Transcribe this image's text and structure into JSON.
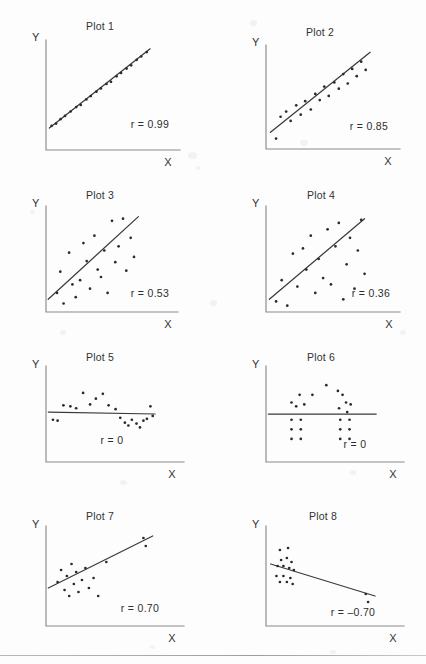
{
  "page": {
    "background_color": "#fdfdfd",
    "ink_color": "#2b2b2b",
    "axis_color": "#8a8a8a",
    "has_bottom_rule": true
  },
  "chart_data": [
    {
      "type": "scatter",
      "title": "Plot 1",
      "xlabel": "X",
      "ylabel": "Y",
      "annotation": "r = 0.99",
      "correlation": 0.99,
      "grid": false,
      "legend": "none",
      "xlim": [
        0,
        100
      ],
      "ylim": [
        0,
        100
      ],
      "fit_line": {
        "x1": 3,
        "y1": 20,
        "x2": 93,
        "y2": 92
      },
      "points": [
        [
          5,
          22
        ],
        [
          9,
          24
        ],
        [
          13,
          28
        ],
        [
          17,
          31
        ],
        [
          22,
          35
        ],
        [
          27,
          39
        ],
        [
          31,
          41
        ],
        [
          36,
          46
        ],
        [
          40,
          49
        ],
        [
          45,
          53
        ],
        [
          49,
          56
        ],
        [
          54,
          60
        ],
        [
          58,
          62
        ],
        [
          63,
          67
        ],
        [
          67,
          70
        ],
        [
          72,
          74
        ],
        [
          76,
          77
        ],
        [
          81,
          82
        ],
        [
          85,
          85
        ],
        [
          90,
          89
        ]
      ]
    },
    {
      "type": "scatter",
      "title": "Plot 2",
      "xlabel": "X",
      "ylabel": "Y",
      "annotation": "r = 0.85",
      "correlation": 0.85,
      "grid": false,
      "legend": "none",
      "xlim": [
        0,
        100
      ],
      "ylim": [
        0,
        100
      ],
      "fit_line": {
        "x1": 4,
        "y1": 16,
        "x2": 93,
        "y2": 93
      },
      "points": [
        [
          9,
          10
        ],
        [
          13,
          31
        ],
        [
          18,
          36
        ],
        [
          22,
          27
        ],
        [
          27,
          42
        ],
        [
          31,
          33
        ],
        [
          35,
          46
        ],
        [
          40,
          38
        ],
        [
          44,
          53
        ],
        [
          48,
          47
        ],
        [
          52,
          60
        ],
        [
          56,
          51
        ],
        [
          61,
          64
        ],
        [
          65,
          58
        ],
        [
          69,
          72
        ],
        [
          73,
          63
        ],
        [
          77,
          77
        ],
        [
          81,
          70
        ],
        [
          85,
          84
        ],
        [
          89,
          76
        ]
      ]
    },
    {
      "type": "scatter",
      "title": "Plot 3",
      "xlabel": "X",
      "ylabel": "Y",
      "annotation": "r = 0.53",
      "correlation": 0.53,
      "grid": false,
      "legend": "none",
      "xlim": [
        0,
        100
      ],
      "ylim": [
        0,
        100
      ],
      "fit_line": {
        "x1": 2,
        "y1": 12,
        "x2": 84,
        "y2": 90
      },
      "points": [
        [
          10,
          18
        ],
        [
          13,
          38
        ],
        [
          16,
          8
        ],
        [
          21,
          56
        ],
        [
          24,
          26
        ],
        [
          27,
          14
        ],
        [
          31,
          30
        ],
        [
          34,
          65
        ],
        [
          37,
          48
        ],
        [
          40,
          22
        ],
        [
          44,
          72
        ],
        [
          47,
          40
        ],
        [
          50,
          33
        ],
        [
          53,
          58
        ],
        [
          56,
          18
        ],
        [
          60,
          86
        ],
        [
          63,
          47
        ],
        [
          66,
          62
        ],
        [
          70,
          88
        ],
        [
          73,
          39
        ],
        [
          77,
          70
        ],
        [
          80,
          52
        ]
      ]
    },
    {
      "type": "scatter",
      "title": "Plot 4",
      "xlabel": "X",
      "ylabel": "Y",
      "annotation": "r = 0.36",
      "correlation": 0.36,
      "grid": false,
      "legend": "none",
      "xlim": [
        0,
        100
      ],
      "ylim": [
        0,
        100
      ],
      "fit_line": {
        "x1": 3,
        "y1": 12,
        "x2": 88,
        "y2": 88
      },
      "points": [
        [
          9,
          10
        ],
        [
          14,
          30
        ],
        [
          19,
          6
        ],
        [
          24,
          55
        ],
        [
          28,
          24
        ],
        [
          33,
          60
        ],
        [
          36,
          40
        ],
        [
          40,
          72
        ],
        [
          44,
          18
        ],
        [
          47,
          50
        ],
        [
          51,
          32
        ],
        [
          55,
          78
        ],
        [
          58,
          26
        ],
        [
          62,
          62
        ],
        [
          65,
          84
        ],
        [
          69,
          12
        ],
        [
          72,
          45
        ],
        [
          75,
          70
        ],
        [
          79,
          22
        ],
        [
          82,
          58
        ],
        [
          85,
          87
        ],
        [
          88,
          36
        ]
      ]
    },
    {
      "type": "scatter",
      "title": "Plot 5",
      "xlabel": "X",
      "ylabel": "Y",
      "annotation": "r = 0",
      "correlation": 0,
      "grid": false,
      "legend": "none",
      "xlim": [
        0,
        100
      ],
      "ylim": [
        0,
        100
      ],
      "fit_line": {
        "x1": 2,
        "y1": 52,
        "x2": 94,
        "y2": 50
      },
      "points": [
        [
          6,
          44
        ],
        [
          10,
          43
        ],
        [
          15,
          59
        ],
        [
          21,
          58
        ],
        [
          26,
          56
        ],
        [
          32,
          72
        ],
        [
          38,
          60
        ],
        [
          43,
          66
        ],
        [
          49,
          71
        ],
        [
          54,
          59
        ],
        [
          60,
          55
        ],
        [
          64,
          46
        ],
        [
          68,
          41
        ],
        [
          71,
          38
        ],
        [
          74,
          44
        ],
        [
          78,
          40
        ],
        [
          81,
          36
        ],
        [
          84,
          43
        ],
        [
          87,
          45
        ],
        [
          90,
          58
        ],
        [
          92,
          48
        ]
      ]
    },
    {
      "type": "scatter",
      "title": "Plot 6",
      "xlabel": "X",
      "ylabel": "Y",
      "annotation": "r = 0",
      "correlation": 0,
      "grid": false,
      "legend": "none",
      "xlim": [
        0,
        100
      ],
      "ylim": [
        0,
        100
      ],
      "fit_line": {
        "x1": 2,
        "y1": 50,
        "x2": 95,
        "y2": 50
      },
      "points": [
        [
          22,
          62
        ],
        [
          29,
          70
        ],
        [
          26,
          58
        ],
        [
          33,
          60
        ],
        [
          40,
          70
        ],
        [
          52,
          80
        ],
        [
          62,
          74
        ],
        [
          69,
          62
        ],
        [
          66,
          70
        ],
        [
          73,
          60
        ],
        [
          70,
          52
        ],
        [
          63,
          56
        ],
        [
          22,
          44
        ],
        [
          30,
          44
        ],
        [
          22,
          34
        ],
        [
          30,
          34
        ],
        [
          22,
          24
        ],
        [
          30,
          24
        ],
        [
          64,
          44
        ],
        [
          72,
          44
        ],
        [
          64,
          34
        ],
        [
          72,
          34
        ],
        [
          64,
          24
        ],
        [
          72,
          24
        ]
      ]
    },
    {
      "type": "scatter",
      "title": "Plot 7",
      "xlabel": "X",
      "ylabel": "Y",
      "annotation": "r = 0.70",
      "correlation": 0.7,
      "grid": false,
      "legend": "none",
      "xlim": [
        0,
        100
      ],
      "ylim": [
        0,
        100
      ],
      "fit_line": {
        "x1": 2,
        "y1": 38,
        "x2": 92,
        "y2": 90
      },
      "points": [
        [
          10,
          44
        ],
        [
          13,
          56
        ],
        [
          16,
          36
        ],
        [
          18,
          50
        ],
        [
          20,
          30
        ],
        [
          22,
          62
        ],
        [
          24,
          42
        ],
        [
          26,
          54
        ],
        [
          28,
          34
        ],
        [
          31,
          46
        ],
        [
          34,
          58
        ],
        [
          37,
          38
        ],
        [
          41,
          48
        ],
        [
          45,
          30
        ],
        [
          52,
          64
        ],
        [
          84,
          88
        ],
        [
          86,
          80
        ]
      ]
    },
    {
      "type": "scatter",
      "title": "Plot 8",
      "xlabel": "X",
      "ylabel": "Y",
      "annotation": "r = –0.70",
      "correlation": -0.7,
      "grid": false,
      "legend": "none",
      "xlim": [
        0,
        100
      ],
      "ylim": [
        0,
        100
      ],
      "fit_line": {
        "x1": 4,
        "y1": 62,
        "x2": 94,
        "y2": 30
      },
      "points": [
        [
          12,
          76
        ],
        [
          19,
          78
        ],
        [
          13,
          66
        ],
        [
          18,
          68
        ],
        [
          22,
          64
        ],
        [
          10,
          60
        ],
        [
          15,
          60
        ],
        [
          20,
          58
        ],
        [
          24,
          56
        ],
        [
          9,
          50
        ],
        [
          15,
          50
        ],
        [
          21,
          48
        ],
        [
          12,
          44
        ],
        [
          18,
          44
        ],
        [
          23,
          42
        ],
        [
          86,
          32
        ],
        [
          88,
          24
        ]
      ]
    }
  ]
}
